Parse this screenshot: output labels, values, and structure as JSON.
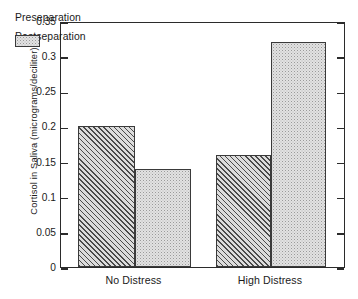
{
  "chart_data": {
    "type": "bar",
    "title": "",
    "xlabel": "",
    "ylabel": "Cortisol in Saliva (micrograms/deciliter)",
    "categories": [
      "No Distress",
      "High Distress"
    ],
    "series": [
      {
        "name": "Preseparation",
        "values": [
          0.2,
          0.16
        ]
      },
      {
        "name": "Postseparation",
        "values": [
          0.14,
          0.32
        ]
      }
    ],
    "ylim": [
      0,
      0.35
    ],
    "ytick_values": [
      0,
      0.05,
      0.1,
      0.15,
      0.2,
      0.25,
      0.3,
      0.35
    ],
    "ytick_labels": [
      "0",
      "0.05",
      "0.1",
      "0.15",
      "0.2",
      "0.25",
      "0.3",
      "0.35"
    ],
    "grid": false,
    "legend_position": "upper-left-inside",
    "annotations": []
  },
  "legend": {
    "items": [
      {
        "label": "Preseparation",
        "pattern": "diagonal-hatch"
      },
      {
        "label": "Postseparation",
        "pattern": "stipple"
      }
    ]
  },
  "colors": {
    "axis": "#2b2b2b",
    "bar_outline": "#3a3a3a",
    "preseparation_fill": "#dcdcdc",
    "postseparation_fill": "#e2e2e2",
    "background": "#ffffff",
    "text": "#1a1a1a"
  }
}
